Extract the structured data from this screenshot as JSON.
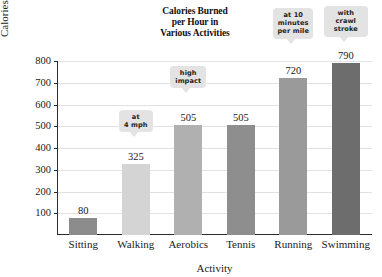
{
  "chart_data": {
    "type": "bar",
    "title": "Calories Burned per Hour in Various Activities",
    "title_lines": [
      "Calories Burned",
      "per Hour in",
      "Various Activities"
    ],
    "xlabel": "Activity",
    "ylabel": "Calories Burned per Hour",
    "categories": [
      "Sitting",
      "Walking",
      "Aerobics",
      "Tennis",
      "Running",
      "Swimming"
    ],
    "values": [
      80,
      325,
      505,
      505,
      720,
      790
    ],
    "value_labels": [
      "80",
      "325",
      "505",
      "505",
      "720",
      "790"
    ],
    "ylim": [
      0,
      800
    ],
    "yticks": [
      100,
      200,
      300,
      400,
      500,
      600,
      700,
      800
    ],
    "ytick_labels": [
      "100",
      "200",
      "300",
      "400",
      "500",
      "600",
      "700",
      "800"
    ],
    "grid": true,
    "legend": "none",
    "bar_colors": [
      "#8c8c8c",
      "#d4d4d4",
      "#b0b0b0",
      "#8e8e8e",
      "#9a9a9a",
      "#6d6d6d"
    ],
    "annotations": [
      {
        "category": "Walking",
        "lines": [
          "at",
          "4 mph"
        ]
      },
      {
        "category": "Aerobics",
        "lines": [
          "high",
          "impact"
        ]
      },
      {
        "category": "Running",
        "lines": [
          "at 10",
          "minutes",
          "per mile"
        ]
      },
      {
        "category": "Swimming",
        "lines": [
          "with crawl",
          "stroke"
        ]
      }
    ]
  }
}
